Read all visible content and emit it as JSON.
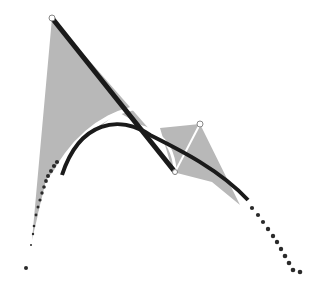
{
  "diagram": {
    "type": "bezier-curve-construction",
    "background": "#ffffff",
    "control_points": [
      [
        26,
        268
      ],
      [
        52,
        18
      ],
      [
        200,
        124
      ],
      [
        173,
        172
      ],
      [
        300,
        268
      ]
    ],
    "fill_color": "#b8b8b8",
    "line_color": "#1a1a1a",
    "highlight_color": "#ffffff",
    "dot_color": "#2a2a2a"
  }
}
